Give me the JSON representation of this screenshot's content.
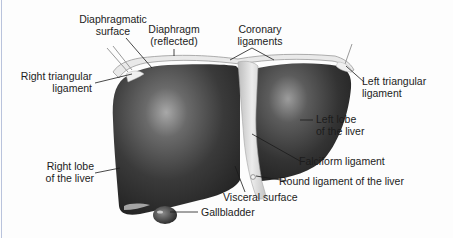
{
  "diagram": {
    "colors": {
      "background": "#fdfdfd",
      "liver_dark": "#2e2e2e",
      "liver_mid": "#5a5a5a",
      "liver_highlight": "#9a9a9a",
      "diaphragm": "#e6e6e6",
      "ligament": "#d8d8d8",
      "leader_line": "#1a1a1a",
      "frame_edge": "#b9c3dc"
    },
    "labels": {
      "diaphragmatic_surface": {
        "line1": "Diaphragmatic",
        "line2": "surface"
      },
      "diaphragm_reflected": {
        "line1": "Diaphragm",
        "line2": "(reflected)"
      },
      "coronary_ligaments": {
        "line1": "Coronary",
        "line2": "ligaments"
      },
      "right_triangular_ligament": {
        "line1": "Right triangular",
        "line2": "ligament"
      },
      "left_triangular_ligament": {
        "line1": "Left triangular",
        "line2": "ligament"
      },
      "left_lobe": {
        "line1": "Left lobe",
        "line2": "of the liver"
      },
      "right_lobe": {
        "line1": "Right lobe",
        "line2": "of the liver"
      },
      "falciform_ligament": "Falciform ligament",
      "round_ligament": "Round ligament of the liver",
      "visceral_surface": "Visceral surface",
      "gallbladder": "Gallbladder"
    }
  }
}
